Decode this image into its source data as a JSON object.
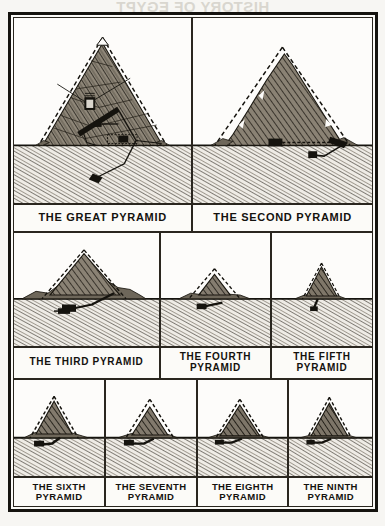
{
  "page": {
    "bleed_text": "HISTORY OF EGYPT",
    "plate_title": "",
    "ink_color": "#15130f",
    "paper_color": "#fbfaf7",
    "stone_color": "#8d8577",
    "ground_color": "#efece6"
  },
  "rows": [
    {
      "id": "row-1",
      "cells": [
        {
          "id": "great-pyramid",
          "caption": "THE GREAT PYRAMID",
          "scene": "great",
          "features": [
            "casing-outline",
            "grand-gallery",
            "kings-chamber",
            "queens-chamber",
            "descending-passage",
            "subterranean-chamber"
          ]
        },
        {
          "id": "second-pyramid",
          "caption": "THE SECOND PYRAMID",
          "scene": "second",
          "features": [
            "casing-outline",
            "burial-chamber",
            "entrance-passage"
          ]
        }
      ]
    },
    {
      "id": "row-2",
      "cells": [
        {
          "id": "third-pyramid",
          "caption": "THE THIRD PYRAMID",
          "scene": "third",
          "features": [
            "casing-outline",
            "rubble-mound",
            "subterranean-chamber",
            "descending-passage"
          ]
        },
        {
          "id": "fourth-pyramid",
          "caption": "THE FOURTH\nPYRAMID",
          "scene": "fourth",
          "features": [
            "casing-outline",
            "rubble-mound",
            "subterranean-chamber"
          ]
        },
        {
          "id": "fifth-pyramid",
          "caption": "THE FIFTH\nPYRAMID",
          "scene": "fifth",
          "features": [
            "casing-outline",
            "rubble-mound",
            "shaft"
          ]
        }
      ]
    },
    {
      "id": "row-3",
      "cells": [
        {
          "id": "sixth-pyramid",
          "caption": "THE SIXTH\nPYRAMID",
          "scene": "sixth",
          "features": [
            "casing-outline",
            "rubble-mound",
            "subterranean-chamber"
          ]
        },
        {
          "id": "seventh-pyramid",
          "caption": "THE SEVENTH\nPYRAMID",
          "scene": "seventh",
          "features": [
            "casing-outline",
            "rubble-mound",
            "subterranean-chamber"
          ]
        },
        {
          "id": "eighth-pyramid",
          "caption": "THE EIGHTH\nPYRAMID",
          "scene": "eighth",
          "features": [
            "casing-outline",
            "rubble-mound",
            "subterranean-chamber"
          ]
        },
        {
          "id": "ninth-pyramid",
          "caption": "THE NINTH\nPYRAMID",
          "scene": "ninth",
          "features": [
            "casing-outline",
            "rubble-mound",
            "subterranean-chamber"
          ]
        }
      ]
    }
  ]
}
